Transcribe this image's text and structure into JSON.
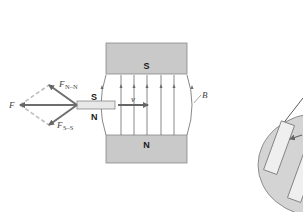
{
  "diagram": {
    "magnet_top": {
      "pole_label": "S",
      "fill": "#c9c9c9"
    },
    "magnet_bottom": {
      "pole_label": "N",
      "fill": "#c9c9c9"
    },
    "small_magnet": {
      "top_label": "S",
      "bottom_label": "N",
      "fill": "#e8e8e8"
    },
    "field_label": "B",
    "velocity_label": "v",
    "forces": {
      "net": {
        "label": "F"
      },
      "n_n": {
        "label": "F",
        "subscript": "N–N"
      },
      "s_s": {
        "label": "F",
        "subscript": "S–S"
      }
    },
    "colors": {
      "force_arrow": "#6e6e6e",
      "dashed_component": "#bdbdbd",
      "field_line": "#6a6a6a",
      "velocity_arrow": "#666666",
      "inset_fill": "#d4d4d4"
    }
  }
}
